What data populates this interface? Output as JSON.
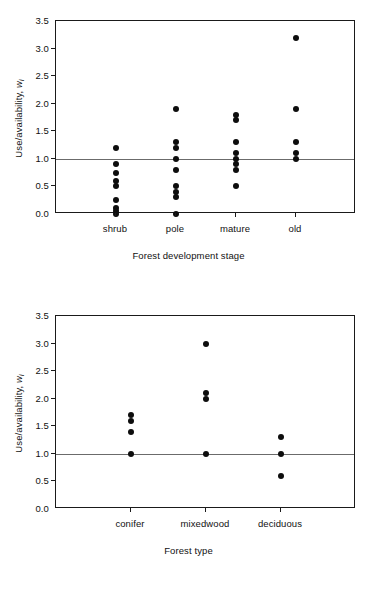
{
  "chart_data": [
    {
      "type": "scatter",
      "title": "",
      "xlabel": "Forest development stage",
      "ylabel": "Use/availability, w_i",
      "ylabel_main": "Use/availability, ",
      "ylabel_symbol": "w",
      "ylabel_subscript": "i",
      "categories": [
        "shrub",
        "pole",
        "mature",
        "old"
      ],
      "ylim": [
        0.0,
        3.5
      ],
      "yticks": [
        0.0,
        0.5,
        1.0,
        1.5,
        2.0,
        2.5,
        3.0,
        3.5
      ],
      "ytick_labels": [
        "0.0",
        "0.5",
        "1.0",
        "1.5",
        "2.0",
        "2.5",
        "3.0",
        "3.5"
      ],
      "grid": false,
      "legend": "none",
      "reference_line": 1.0,
      "series": [
        {
          "name": "shrub",
          "values": [
            1.2,
            0.9,
            0.75,
            0.6,
            0.5,
            0.25,
            0.1,
            0.05,
            0.0
          ]
        },
        {
          "name": "pole",
          "values": [
            1.9,
            1.3,
            1.2,
            1.0,
            0.8,
            0.5,
            0.4,
            0.3,
            0.0
          ]
        },
        {
          "name": "mature",
          "values": [
            1.8,
            1.7,
            1.3,
            1.1,
            1.0,
            0.9,
            0.8,
            0.5
          ]
        },
        {
          "name": "old",
          "values": [
            3.2,
            1.9,
            1.3,
            1.1,
            1.0
          ]
        }
      ]
    },
    {
      "type": "scatter",
      "title": "",
      "xlabel": "Forest type",
      "ylabel": "Use/availability, w_i",
      "ylabel_main": "Use/availability, ",
      "ylabel_symbol": "w",
      "ylabel_subscript": "i",
      "categories": [
        "conifer",
        "mixedwood",
        "deciduous"
      ],
      "ylim": [
        0.0,
        3.5
      ],
      "yticks": [
        0.0,
        0.5,
        1.0,
        1.5,
        2.0,
        2.5,
        3.0,
        3.5
      ],
      "ytick_labels": [
        "0.0",
        "0.5",
        "1.0",
        "1.5",
        "2.0",
        "2.5",
        "3.0",
        "3.5"
      ],
      "grid": false,
      "legend": "none",
      "reference_line": 1.0,
      "series": [
        {
          "name": "conifer",
          "values": [
            1.7,
            1.6,
            1.4,
            1.0
          ]
        },
        {
          "name": "mixedwood",
          "values": [
            3.0,
            2.1,
            2.0,
            1.0
          ]
        },
        {
          "name": "deciduous",
          "values": [
            1.3,
            1.0,
            0.6
          ]
        }
      ]
    }
  ],
  "style": {
    "point_color": "#0d0d0d",
    "axis_color": "#1a1a1a",
    "reference_line_color": "#6b6b6b",
    "background": "#ffffff"
  }
}
